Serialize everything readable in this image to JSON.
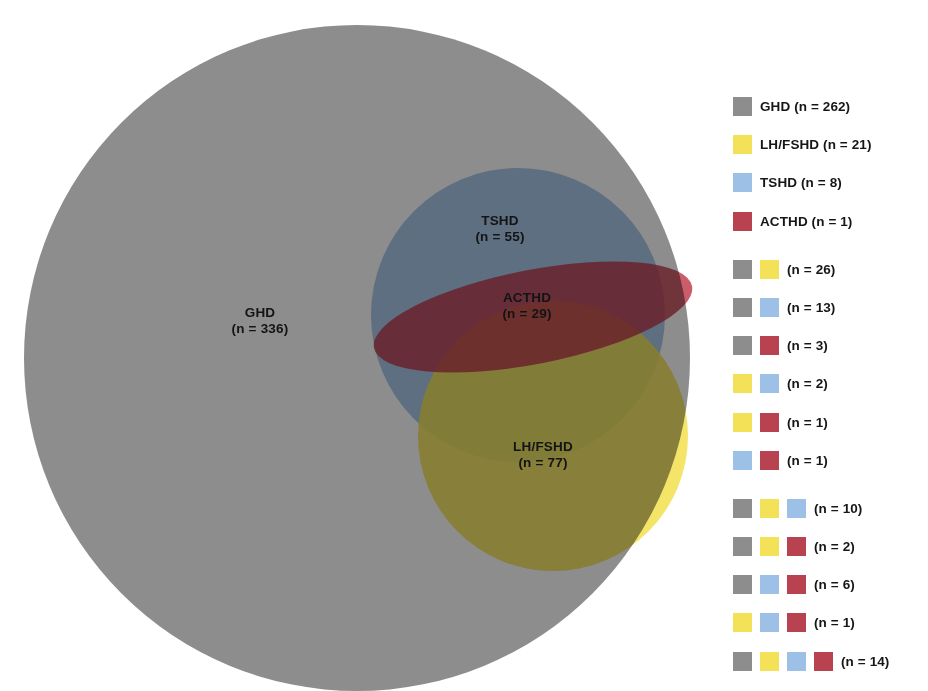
{
  "chart_data": {
    "type": "venn",
    "title": "",
    "sets": [
      {
        "key": "GHD",
        "label": "GHD",
        "n": 336,
        "color": "#8d8d8d",
        "display": "GHD\n(n = 336)"
      },
      {
        "key": "TSHD",
        "label": "TSHD",
        "n": 55,
        "color": "#9cc0e6",
        "display": "TSHD\n(n = 55)"
      },
      {
        "key": "ACTHD",
        "label": "ACTHD",
        "n": 29,
        "color": "#b8424f",
        "display": "ACTHD\n(n = 29)"
      },
      {
        "key": "LH/FSHD",
        "label": "LH/FSHD",
        "n": 77,
        "color": "#f3e258",
        "display": "LH/FSHD\n(n = 77)"
      }
    ],
    "region_counts": [
      {
        "sets": [
          "GHD"
        ],
        "n": 262
      },
      {
        "sets": [
          "LH/FSHD"
        ],
        "n": 21
      },
      {
        "sets": [
          "TSHD"
        ],
        "n": 8
      },
      {
        "sets": [
          "ACTHD"
        ],
        "n": 1
      },
      {
        "sets": [
          "GHD",
          "LH/FSHD"
        ],
        "n": 26
      },
      {
        "sets": [
          "GHD",
          "TSHD"
        ],
        "n": 13
      },
      {
        "sets": [
          "GHD",
          "ACTHD"
        ],
        "n": 3
      },
      {
        "sets": [
          "LH/FSHD",
          "TSHD"
        ],
        "n": 2
      },
      {
        "sets": [
          "LH/FSHD",
          "ACTHD"
        ],
        "n": 1
      },
      {
        "sets": [
          "TSHD",
          "ACTHD"
        ],
        "n": 1
      },
      {
        "sets": [
          "GHD",
          "LH/FSHD",
          "TSHD"
        ],
        "n": 10
      },
      {
        "sets": [
          "GHD",
          "LH/FSHD",
          "ACTHD"
        ],
        "n": 2
      },
      {
        "sets": [
          "GHD",
          "TSHD",
          "ACTHD"
        ],
        "n": 6
      },
      {
        "sets": [
          "LH/FSHD",
          "TSHD",
          "ACTHD"
        ],
        "n": 1
      },
      {
        "sets": [
          "GHD",
          "LH/FSHD",
          "TSHD",
          "ACTHD"
        ],
        "n": 14
      }
    ]
  },
  "diagram": {
    "labels": [
      {
        "name": "ghd",
        "line1": "GHD",
        "line2": "(n = 336)"
      },
      {
        "name": "tshd",
        "line1": "TSHD",
        "line2": "(n = 55)"
      },
      {
        "name": "acthd",
        "line1": "ACTHD",
        "line2": "(n = 29)"
      },
      {
        "name": "lhfshd",
        "line1": "LH/FSHD",
        "line2": "(n = 77)"
      }
    ]
  },
  "legend": {
    "rows": [
      {
        "swatches": [
          "gray"
        ],
        "text": "GHD (n = 262)"
      },
      {
        "swatches": [
          "yellow"
        ],
        "text": "LH/FSHD (n = 21)"
      },
      {
        "swatches": [
          "blue"
        ],
        "text": "TSHD (n = 8)"
      },
      {
        "swatches": [
          "red"
        ],
        "text": "ACTHD (n = 1)"
      },
      {
        "swatches": [
          "gray",
          "yellow"
        ],
        "text": "(n = 26)"
      },
      {
        "swatches": [
          "gray",
          "blue"
        ],
        "text": "(n = 13)"
      },
      {
        "swatches": [
          "gray",
          "red"
        ],
        "text": "(n = 3)"
      },
      {
        "swatches": [
          "yellow",
          "blue"
        ],
        "text": "(n = 2)"
      },
      {
        "swatches": [
          "yellow",
          "red"
        ],
        "text": "(n = 1)"
      },
      {
        "swatches": [
          "blue",
          "red"
        ],
        "text": "(n = 1)"
      },
      {
        "swatches": [
          "gray",
          "yellow",
          "blue"
        ],
        "text": "(n = 10)"
      },
      {
        "swatches": [
          "gray",
          "yellow",
          "red"
        ],
        "text": "(n = 2)"
      },
      {
        "swatches": [
          "gray",
          "blue",
          "red"
        ],
        "text": "(n = 6)"
      },
      {
        "swatches": [
          "yellow",
          "blue",
          "red"
        ],
        "text": "(n = 1)"
      },
      {
        "swatches": [
          "gray",
          "yellow",
          "blue",
          "red"
        ],
        "text": "(n = 14)"
      }
    ]
  },
  "colors": {
    "gray": "#8d8d8d",
    "yellow": "#f3e258",
    "blue": "#9cc0e6",
    "red": "#b8424f",
    "background": "#ffffff"
  }
}
